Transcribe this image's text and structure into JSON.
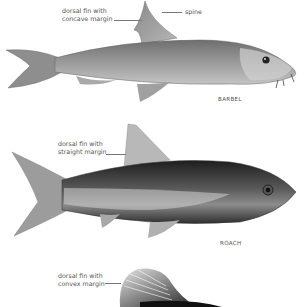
{
  "figures": [
    {
      "species": "BARBEL",
      "annotations": [
        {
          "id": "dorsal",
          "text": "dorsal fin with\nconcave margin"
        },
        {
          "id": "spine",
          "text": "spine"
        }
      ]
    },
    {
      "species": "ROACH",
      "annotations": [
        {
          "id": "dorsal",
          "text": "dorsal fin with\nstraight margin"
        }
      ]
    },
    {
      "species": "",
      "annotations": [
        {
          "id": "dorsal",
          "text": "dorsal fin with\nconvex margin"
        }
      ]
    }
  ],
  "colors": {
    "background": "#ffffff",
    "label_text": "#555555",
    "leader_line": "#777777",
    "barbel_body": "#8c8c8c",
    "roach_body": "#3a3a3a"
  }
}
